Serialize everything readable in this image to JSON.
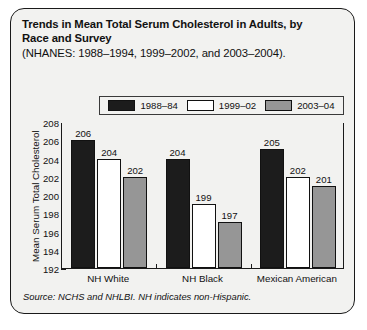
{
  "card": {
    "title_line1": "Trends in Mean Total Serum Cholesterol in Adults, by",
    "title_line2": "Race and Survey",
    "subtitle": "(NHANES: 1988–1994, 1999–2002, and 2003–2004).",
    "source": "Source: NCHS and NHLBI. NH indicates non-Hispanic."
  },
  "colors": {
    "series_1988": "#1c1c1c",
    "series_1999": "#ffffff",
    "series_2003": "#969696",
    "card_background": "#f2f2f0",
    "border": "#1a1a1a",
    "text": "#111111"
  },
  "chart_data": {
    "type": "bar",
    "title": "Trends in Mean Total Serum Cholesterol in Adults, by Race and Survey",
    "subtitle": "(NHANES: 1988–1994, 1999–2002, and 2003–2004).",
    "xlabel": "",
    "ylabel": "Mean Serum Total Cholesterol",
    "ylim": [
      192,
      208
    ],
    "ytick_labels": [
      "208",
      "206",
      "204",
      "202",
      "200",
      "198",
      "196",
      "194",
      "192"
    ],
    "yticks": [
      208,
      206,
      204,
      202,
      200,
      198,
      196,
      194,
      192
    ],
    "grid": false,
    "legend_position": "top",
    "categories": [
      "NH White",
      "NH Black",
      "Mexican American"
    ],
    "series": [
      {
        "name": "1988–84",
        "color": "#1c1c1c",
        "values": [
          206,
          204,
          205
        ]
      },
      {
        "name": "1999–02",
        "color": "#ffffff",
        "values": [
          204,
          199,
          202
        ]
      },
      {
        "name": "2003–04",
        "color": "#969696",
        "values": [
          202,
          197,
          201
        ]
      }
    ]
  }
}
